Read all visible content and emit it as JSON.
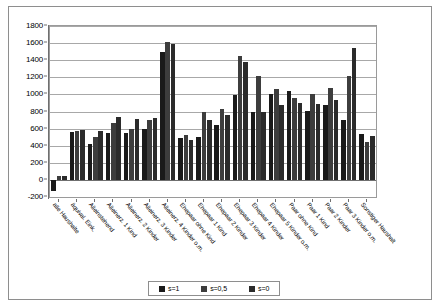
{
  "chart_data": {
    "type": "bar",
    "title": "",
    "subtitle": "",
    "xlabel": "",
    "ylabel": "",
    "ylim": [
      -200,
      1800
    ],
    "ytick_step": 200,
    "yticks": [
      1800,
      1600,
      1400,
      1200,
      1000,
      800,
      600,
      400,
      200,
      0,
      -200
    ],
    "ytick_labels": [
      "1800",
      "1600",
      "1400",
      "1200",
      "1000",
      "800",
      "600",
      "400",
      "200",
      "0",
      "-200"
    ],
    "grid": true,
    "grid_axis": "y",
    "legend_position": "bottom",
    "categories": [
      "alle Haushalte",
      "äquival. Eink.",
      "Alleinstehend",
      "Alleinerz. 1 Kind",
      "Alleinerz. 2 Kinder",
      "Alleinerz. 3 Kinder",
      "Alleinerz. 4 Kinder o.m.",
      "Ehepaar ohne Kind",
      "Ehepaar 1 Kind",
      "Ehepaar 2 Kinder",
      "Ehepaar 3 Kinder",
      "Ehepaar 4 Kinder",
      "Ehepaar 5 Kinder o.m.",
      "Paar ohne Kind",
      "Paar 1 Kind",
      "Paar 2 Kinder",
      "Paar 3 Kinder o.m.",
      "Sonstiger Haushalt"
    ],
    "series": [
      {
        "name": "s=1",
        "color": "#1a1a1a",
        "values": [
          -130,
          560,
          420,
          550,
          545,
          600,
          1500,
          490,
          500,
          640,
          990,
          800,
          1000,
          1040,
          810,
          880,
          700,
          540
        ]
      },
      {
        "name": "s=0,5",
        "color": "#3d3d3d",
        "values": [
          40,
          570,
          500,
          660,
          600,
          700,
          1610,
          520,
          790,
          830,
          1450,
          1210,
          1060,
          960,
          1010,
          1070,
          1220,
          440
        ]
      },
      {
        "name": "s=0",
        "color": "#2b2b2b",
        "values": [
          50,
          580,
          570,
          740,
          710,
          720,
          1590,
          470,
          700,
          760,
          1380,
          800,
          880,
          900,
          890,
          930,
          1540,
          510
        ]
      }
    ]
  },
  "legend": {
    "items": [
      {
        "label": "s=1",
        "color": "#1a1a1a"
      },
      {
        "label": "s=0,5",
        "color": "#3d3d3d"
      },
      {
        "label": "s=0",
        "color": "#2b2b2b"
      }
    ]
  }
}
